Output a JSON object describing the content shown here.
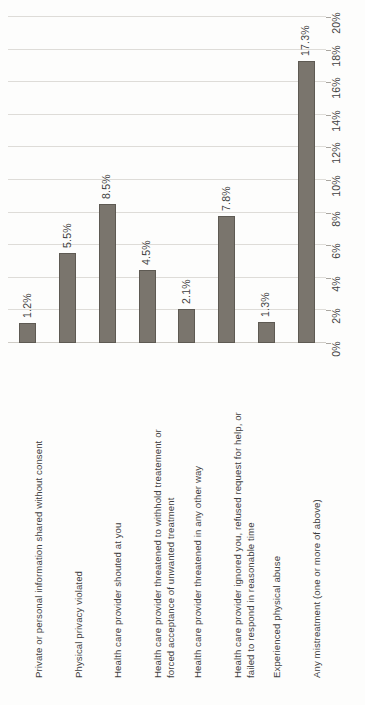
{
  "chart_data": {
    "type": "bar",
    "title": "",
    "subtitle": "",
    "xlabel": "",
    "ylabel": "",
    "orientation": "vertical-bars-on-rotated-page",
    "grid": true,
    "legend": false,
    "legend_position": "none",
    "value_axis_position": "right",
    "ylim": [
      0,
      20
    ],
    "ytick_step": 2,
    "ytick_labels": [
      "0%",
      "2%",
      "4%",
      "6%",
      "8%",
      "10%",
      "12%",
      "14%",
      "16%",
      "18%",
      "20%"
    ],
    "ytick_values": [
      0,
      2,
      4,
      6,
      8,
      10,
      12,
      14,
      16,
      18,
      20
    ],
    "categories": [
      "Private or personal information shared without consent",
      "Physical privacy violated",
      "Health care provider shouted at you",
      "Health care provider threatened to withhold treatement or forced acceptance of unwanted treatment",
      "Health care provider threatened in any other way",
      "Health care provider ignored you, refused request for help, or failed to respond in reasonable time",
      "Experienced physical abuse",
      "Any mistreatment (one or more of above)"
    ],
    "category_lines": [
      [
        "Private or personal information shared without consent"
      ],
      [
        "Physical privacy violated"
      ],
      [
        "Health care provider shouted at you"
      ],
      [
        "Health care provider threatened to withhold treatement or",
        "forced acceptance of unwanted treatment"
      ],
      [
        "Health care provider threatened in any other way"
      ],
      [
        "Health care provider ignored you, refused request for help, or",
        "failed to respond in reasonable time"
      ],
      [
        "Experienced physical abuse"
      ],
      [
        "Any mistreatment (one or more of above)"
      ]
    ],
    "values": [
      1.2,
      5.5,
      8.5,
      4.5,
      2.1,
      7.8,
      1.3,
      17.3
    ],
    "data_labels": [
      "1.2%",
      "5.5%",
      "8.5%",
      "4.5%",
      "2.1%",
      "7.8%",
      "1.3%",
      "17.3%"
    ],
    "colors": {
      "bar_fill": "#7a756d",
      "bar_stroke": "#5e5a53",
      "gridline": "#dedcd8",
      "baseline": "#cfccc6",
      "text": "#3f3f3f",
      "background": "#fdfdfc"
    }
  }
}
